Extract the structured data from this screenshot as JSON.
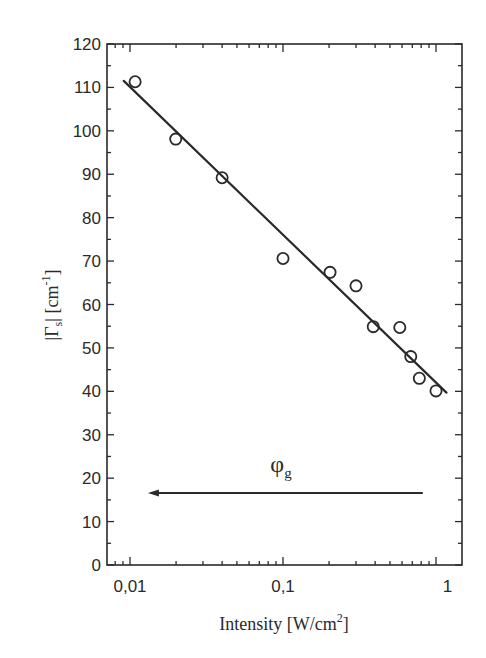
{
  "chart_data": {
    "type": "scatter",
    "title": "",
    "xlabel": "Intensity [W/cm²]",
    "xlabel_parts": {
      "main": "Intensity [W/cm",
      "sup": "2",
      "end": "]"
    },
    "ylabel": "|Γs| [cm⁻¹]",
    "ylabel_parts": {
      "bar_open": "|",
      "gamma": "Γ",
      "sub": "s",
      "bar_close": "|",
      "unit_open": " [cm",
      "sup": "-1",
      "unit_close": "]"
    },
    "x_scale": "log",
    "xlim": [
      0.0086,
      1.19
    ],
    "ylim": [
      0,
      120
    ],
    "x_ticks": [
      {
        "value": 0.01,
        "label": "0,01"
      },
      {
        "value": 0.1,
        "label": "0,1"
      },
      {
        "value": 1.19,
        "label": "1"
      }
    ],
    "y_ticks": [
      0,
      10,
      20,
      30,
      40,
      50,
      60,
      70,
      80,
      90,
      100,
      110,
      120
    ],
    "y_tick_labels": [
      "0",
      "10",
      "20",
      "30",
      "40",
      "50",
      "60",
      "70",
      "80",
      "90",
      "100",
      "110",
      "120"
    ],
    "y_minor_step": 5,
    "grid": false,
    "legend": null,
    "series": [
      {
        "name": "measured",
        "marker": "open-circle",
        "points": [
          {
            "x": 0.0108,
            "y": 111.3
          },
          {
            "x": 0.0199,
            "y": 98.1
          },
          {
            "x": 0.04,
            "y": 89.2
          },
          {
            "x": 0.1,
            "y": 70.6
          },
          {
            "x": 0.203,
            "y": 67.4
          },
          {
            "x": 0.3,
            "y": 64.3
          },
          {
            "x": 0.389,
            "y": 54.9
          },
          {
            "x": 0.58,
            "y": 54.7
          },
          {
            "x": 0.684,
            "y": 48.0
          },
          {
            "x": 0.778,
            "y": 43.0
          },
          {
            "x": 1.0,
            "y": 40.1
          }
        ]
      },
      {
        "name": "fit",
        "type": "line",
        "points": [
          {
            "x": 0.0091,
            "y": 111.5
          },
          {
            "x": 1.17,
            "y": 39.7
          }
        ]
      }
    ],
    "annotations": [
      {
        "type": "arrow",
        "from": {
          "x": 0.82,
          "y": 16.6
        },
        "to": {
          "x": 0.0131,
          "y": 16.6
        },
        "label": "φ",
        "label_sub": "g",
        "label_pos": {
          "x": 0.097,
          "y": 21.5
        }
      }
    ]
  }
}
